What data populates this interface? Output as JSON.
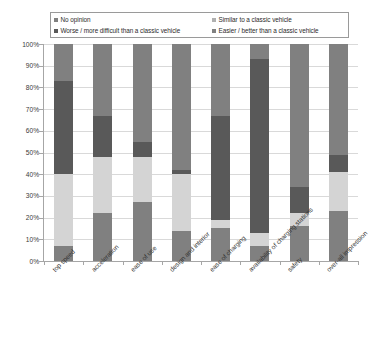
{
  "chart_data": {
    "type": "bar",
    "variant": "stacked-100-percent",
    "title": "",
    "subtitle": "",
    "xlabel": "",
    "ylabel": "",
    "ylim": [
      0,
      100
    ],
    "ytick_labels": [
      "0%",
      "10%",
      "20%",
      "30%",
      "40%",
      "50%",
      "60%",
      "70%",
      "80%",
      "90%",
      "100%"
    ],
    "ytick_values": [
      0,
      10,
      20,
      30,
      40,
      50,
      60,
      70,
      80,
      90,
      100
    ],
    "grid": true,
    "legend_position": "top",
    "categories": [
      "top speed",
      "acceleration",
      "ease of use",
      "design and interior",
      "ease of charging",
      "availability of charging stations",
      "safety",
      "over-all impression"
    ],
    "series": [
      {
        "name": "No opinion",
        "color": "#808080",
        "values": [
          7,
          22,
          27,
          14,
          15,
          7,
          16,
          23
        ]
      },
      {
        "name": "Similar to a classic vehicle",
        "color": "#d4d4d4",
        "values": [
          33,
          26,
          21,
          26,
          4,
          6,
          6,
          18
        ]
      },
      {
        "name": "Worse / more difficult than a classic vehicle",
        "color": "#595959",
        "values": [
          43,
          19,
          7,
          2,
          48,
          80,
          12,
          8
        ]
      },
      {
        "name": "Easier / better than a classic vehicle",
        "color": "#808080",
        "values": [
          17,
          33,
          45,
          58,
          33,
          7,
          66,
          51
        ]
      }
    ]
  },
  "legend": {
    "entries": [
      {
        "label": "No opinion",
        "color": "#808080"
      },
      {
        "label": "Similar to a classic vehicle",
        "color": "#b0b0b0"
      },
      {
        "label": "Worse / more difficult than a classic vehicle",
        "color": "#595959"
      },
      {
        "label": "Easier / better than a classic vehicle",
        "color": "#808080"
      }
    ]
  }
}
